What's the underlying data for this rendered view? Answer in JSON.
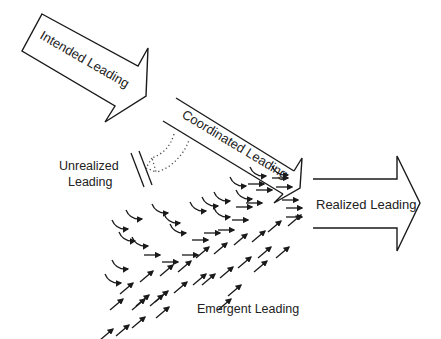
{
  "diagram": {
    "colors": {
      "stroke": "#1a1a1a",
      "background": "#ffffff",
      "text": "#222222"
    },
    "labels": {
      "intended": "Intended Leading",
      "coordinated": "Coordinated Leading",
      "unrealized_line1": "Unrealized",
      "unrealized_line2": "Leading",
      "realized": "Realized Leading",
      "emergent": "Emergent Leading"
    },
    "emergent_arrows": {
      "curved": [
        [
          120,
          228
        ],
        [
          134,
          218
        ],
        [
          160,
          212
        ],
        [
          127,
          240
        ],
        [
          140,
          245
        ],
        [
          172,
          222
        ],
        [
          198,
          210
        ],
        [
          210,
          205
        ],
        [
          222,
          200
        ],
        [
          238,
          185
        ],
        [
          258,
          175
        ],
        [
          280,
          174
        ],
        [
          120,
          268
        ],
        [
          113,
          282
        ],
        [
          178,
          232
        ],
        [
          222,
          216
        ],
        [
          244,
          198
        ]
      ],
      "straight": [
        [
          158,
          255
        ],
        [
          176,
          262
        ],
        [
          196,
          255
        ],
        [
          262,
          184
        ],
        [
          270,
          190
        ],
        [
          286,
          178
        ],
        [
          290,
          187
        ],
        [
          206,
          240
        ],
        [
          218,
          233
        ],
        [
          232,
          230
        ],
        [
          246,
          220
        ],
        [
          250,
          207
        ],
        [
          260,
          203
        ],
        [
          296,
          200
        ],
        [
          300,
          208
        ],
        [
          300,
          217
        ]
      ],
      "diagonal": [
        [
          132,
          284
        ],
        [
          152,
          272
        ],
        [
          172,
          266
        ],
        [
          190,
          262
        ],
        [
          148,
          296
        ],
        [
          167,
          292
        ],
        [
          186,
          283
        ],
        [
          205,
          275
        ],
        [
          122,
          300
        ],
        [
          144,
          300
        ],
        [
          162,
          296
        ],
        [
          214,
          275
        ],
        [
          232,
          268
        ],
        [
          250,
          258
        ],
        [
          270,
          248
        ],
        [
          240,
          286
        ],
        [
          266,
          262
        ],
        [
          288,
          248
        ],
        [
          246,
          235
        ],
        [
          264,
          232
        ],
        [
          280,
          222
        ],
        [
          300,
          216
        ],
        [
          112,
          330
        ],
        [
          128,
          326
        ],
        [
          144,
          318
        ],
        [
          168,
          308
        ],
        [
          208,
          248
        ],
        [
          226,
          244
        ],
        [
          230,
          300
        ]
      ]
    }
  }
}
